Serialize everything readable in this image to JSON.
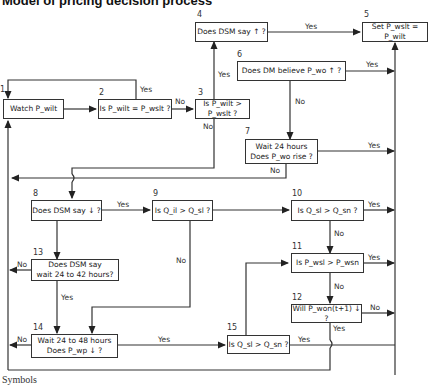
{
  "title": "Model of pricing decision process",
  "nodes": [
    {
      "id": "1",
      "text": "Watch P_wilt"
    },
    {
      "id": "2",
      "text": "Is P_wilt = P_wslt ?"
    },
    {
      "id": "3",
      "text": "Is P_wilt > P_wslt ?"
    },
    {
      "id": "4",
      "text": "Does DSM say ↑ ?"
    },
    {
      "id": "5",
      "text": "Set P_wslt = P_wilt"
    },
    {
      "id": "6",
      "text": "Does DM believe P_wo ↑ ?"
    },
    {
      "id": "7",
      "line1": "Wait 24 hours",
      "line2": "Does P_wo rise ?"
    },
    {
      "id": "8",
      "text": "Does DSM say ↓ ?"
    },
    {
      "id": "9",
      "text": "Is Q_il > Q_sl ?"
    },
    {
      "id": "10",
      "text": "Is Q_sl > Q_sn ?"
    },
    {
      "id": "11",
      "text": "Is P_wsl > P_wsn"
    },
    {
      "id": "12",
      "text": "Will P_won(t+1) ↓ ?"
    },
    {
      "id": "13",
      "line1": "Does DSM say",
      "line2": "wait 24 to 42 hours?"
    },
    {
      "id": "14",
      "line1": "Wait 24 to 48 hours",
      "line2": "Does P_wp ↓ ?"
    },
    {
      "id": "15",
      "text": "Is Q_sl > Q_sn ?"
    }
  ],
  "labels": {
    "yes": "Yes",
    "no": "No"
  },
  "footer": {
    "symbols": "Symbols"
  }
}
